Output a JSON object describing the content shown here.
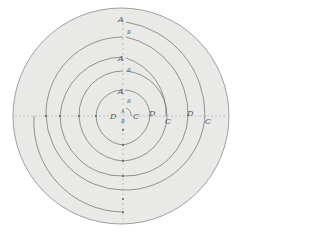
{
  "figure": {
    "title": "",
    "background": "#e9e9e7",
    "stroke": "#7a7a78",
    "labels": [
      {
        "id": "a1",
        "text": "A",
        "x": 118,
        "y": 16
      },
      {
        "id": "b1",
        "text": "B",
        "x": 127,
        "y": 30
      },
      {
        "id": "a2",
        "text": "A",
        "x": 118,
        "y": 55
      },
      {
        "id": "b2",
        "text": "B",
        "x": 127,
        "y": 68
      },
      {
        "id": "a3",
        "text": "A",
        "x": 118,
        "y": 88
      },
      {
        "id": "b3",
        "text": "B",
        "x": 127,
        "y": 99
      },
      {
        "id": "a4",
        "text": "A",
        "x": 121,
        "y": 109,
        "small": true
      },
      {
        "id": "b4",
        "text": "B",
        "x": 121,
        "y": 119,
        "small": true
      },
      {
        "id": "d1",
        "text": "D",
        "x": 110,
        "y": 113
      },
      {
        "id": "c1",
        "text": "C",
        "x": 133,
        "y": 113
      },
      {
        "id": "d2",
        "text": "D",
        "x": 149,
        "y": 110
      },
      {
        "id": "c2",
        "text": "C",
        "x": 165,
        "y": 118
      },
      {
        "id": "d3",
        "text": "D",
        "x": 187,
        "y": 110
      },
      {
        "id": "c3",
        "text": "C",
        "x": 205,
        "y": 118
      }
    ]
  }
}
